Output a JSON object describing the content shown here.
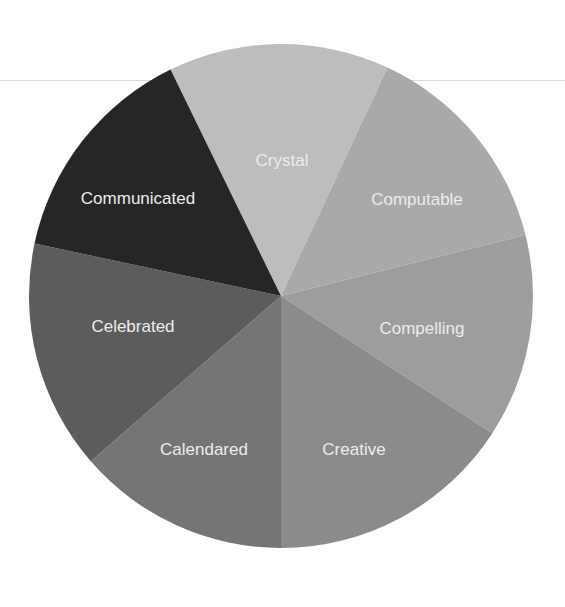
{
  "chart_data": {
    "type": "pie",
    "title": "",
    "center": [
      281,
      296
    ],
    "radius": 252,
    "start_angle_deg": -116,
    "direction": "clockwise",
    "slices": [
      {
        "label": "Crystal",
        "value": 14.29,
        "angle_deg": 51,
        "color": "#bdbdbd",
        "label_pos": [
          282,
          162
        ]
      },
      {
        "label": "Computable",
        "value": 14.29,
        "angle_deg": 51,
        "color": "#a9a9a9",
        "label_pos": [
          417,
          201
        ]
      },
      {
        "label": "Compelling",
        "value": 14.29,
        "angle_deg": 47,
        "color": "#9d9d9d",
        "label_pos": [
          422,
          330
        ]
      },
      {
        "label": "Creative",
        "value": 14.29,
        "angle_deg": 57,
        "color": "#8b8b8b",
        "label_pos": [
          354,
          451
        ]
      },
      {
        "label": "Calendared",
        "value": 14.29,
        "angle_deg": 49,
        "color": "#757575",
        "label_pos": [
          204,
          451
        ]
      },
      {
        "label": "Celebrated",
        "value": 14.29,
        "angle_deg": 53,
        "color": "#5c5c5c",
        "label_pos": [
          133,
          328
        ]
      },
      {
        "label": "Communicated",
        "value": 14.29,
        "angle_deg": 52,
        "color": "#262626",
        "label_pos": [
          138,
          200
        ]
      }
    ],
    "legend": "none",
    "labels_inside": true
  }
}
